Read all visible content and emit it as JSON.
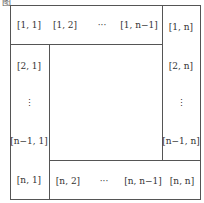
{
  "figure_label": "图",
  "top_row": [
    "[1, 1]",
    "[1, 2]",
    "···",
    "[1, n−1]",
    "[1, n]"
  ],
  "left_col": [
    "[2, 1]",
    "⋮",
    "[n−1, 1]",
    "[n, 1]"
  ],
  "right_col": [
    "[2, n]",
    "⋮",
    "[n−1, n]"
  ],
  "bottom_row": [
    "[n, 2]",
    "···",
    "[n, n−1]",
    "[n, n]"
  ]
}
